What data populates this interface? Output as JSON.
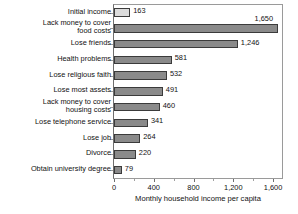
{
  "chart_data": {
    "type": "bar",
    "orientation": "horizontal",
    "title": "",
    "xlabel": "Monthly household income per capita",
    "ylabel": "",
    "xlim": [
      0,
      1700
    ],
    "xticks": [
      0,
      400,
      800,
      1200,
      1600
    ],
    "xtick_labels": [
      "0",
      "400",
      "800",
      "1,200",
      "1,600"
    ],
    "grid": false,
    "legend": null,
    "categories": [
      "Initial income",
      "Lack money to cover\nfood costs",
      "Lose friends",
      "Health problems",
      "Lose religious faith",
      "Lose most assets",
      "Lack money to cover\nhousing costs",
      "Lose telephone service",
      "Lose job",
      "Divorce",
      "Obtain university degree"
    ],
    "values": [
      163,
      1650,
      1246,
      581,
      532,
      491,
      460,
      341,
      264,
      220,
      79
    ],
    "value_labels": [
      "163",
      "1,650",
      "1,246",
      "581",
      "532",
      "491",
      "460",
      "341",
      "264",
      "220",
      "79"
    ],
    "bar_styles": [
      "light",
      "dark",
      "dark",
      "dark",
      "dark",
      "dark",
      "dark",
      "dark",
      "dark",
      "dark",
      "dark"
    ],
    "colors": {
      "bar_dark": "#8a8a8a",
      "bar_light": "#dcdcdc",
      "bar_border": "#3b3b3b",
      "frame": "#9a9a9a",
      "text": "#111111",
      "background": "#ffffff"
    }
  }
}
